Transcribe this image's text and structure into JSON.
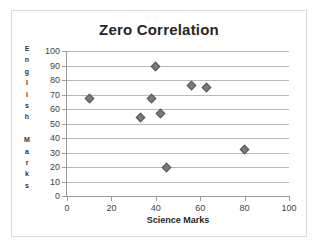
{
  "chart_data": {
    "type": "scatter",
    "title": "Zero Correlation",
    "xlabel": "Science  Marks",
    "ylabel": "English Marks",
    "ylabel_letters": [
      "E",
      "n",
      "g",
      "l",
      "i",
      "s",
      "h",
      "",
      "M",
      "a",
      "r",
      "k",
      "s"
    ],
    "xlim": [
      0,
      100
    ],
    "ylim": [
      0,
      100
    ],
    "xticks": [
      0,
      20,
      40,
      60,
      80,
      100
    ],
    "yticks": [
      0,
      10,
      20,
      30,
      40,
      50,
      60,
      70,
      80,
      90,
      100
    ],
    "grid": "horizontal",
    "legend": "none",
    "series": [
      {
        "name": "Students",
        "marker": "diamond",
        "color": "#7b7b7b",
        "points": [
          {
            "x": 10,
            "y": 67
          },
          {
            "x": 33,
            "y": 54
          },
          {
            "x": 38,
            "y": 67
          },
          {
            "x": 40,
            "y": 89
          },
          {
            "x": 42,
            "y": 57
          },
          {
            "x": 45,
            "y": 20
          },
          {
            "x": 56,
            "y": 76
          },
          {
            "x": 63,
            "y": 75
          },
          {
            "x": 80,
            "y": 32
          }
        ]
      }
    ]
  },
  "style": {
    "marker_fill": "#7b7b7b",
    "marker_stroke": "#595959",
    "gridline_color": "#b8b8b8",
    "axis_color": "#9a9a9a",
    "title_color": "#262626",
    "tick_label_color": "#3f3f3f",
    "card_border": "#d9d9d9",
    "background": "#ffffff"
  }
}
